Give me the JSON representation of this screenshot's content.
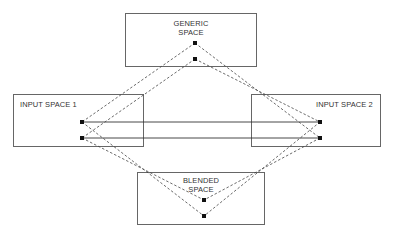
{
  "diagram": {
    "spaces": [
      {
        "id": "generic",
        "label_line1": "GENERIC",
        "label_line2": "SPACE"
      },
      {
        "id": "input1",
        "label": "INPUT SPACE 1"
      },
      {
        "id": "input2",
        "label": "INPUT SPACE 2"
      },
      {
        "id": "blended",
        "label_line1": "BLENDED",
        "label_line2": "SPACE"
      }
    ],
    "colors": {
      "box_stroke": "#555555",
      "line": "#333333",
      "node": "#111111"
    }
  }
}
